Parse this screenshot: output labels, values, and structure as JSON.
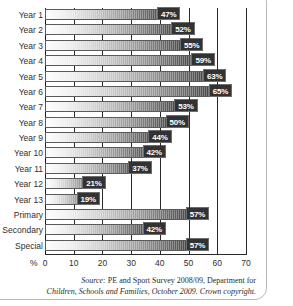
{
  "chart_data": {
    "type": "bar",
    "orientation": "horizontal",
    "title": "",
    "subtitle": "",
    "xlabel": "%",
    "ylabel": "",
    "xlim": [
      0,
      70
    ],
    "xticks": [
      0,
      10,
      20,
      30,
      40,
      50,
      60,
      70
    ],
    "xtick_labels": [
      "0",
      "10",
      "20",
      "30",
      "40",
      "50",
      "60",
      "70"
    ],
    "grid": true,
    "grid_axis": "x",
    "legend": false,
    "legend_position": "none",
    "value_label_suffix": "%",
    "categories": [
      "Year 1",
      "Year 2",
      "Year 3",
      "Year 4",
      "Year 5",
      "Year 6",
      "Year 7",
      "Year 8",
      "Year 9",
      "Year 10",
      "Year 11",
      "Year 12",
      "Year 13",
      "Primary",
      "Secondary",
      "Special"
    ],
    "values": [
      47,
      52,
      55,
      59,
      63,
      65,
      53,
      50,
      44,
      42,
      37,
      21,
      19,
      57,
      42,
      57
    ],
    "value_labels": [
      "47%",
      "52%",
      "55%",
      "59%",
      "63%",
      "65%",
      "53%",
      "50%",
      "44%",
      "42%",
      "37%",
      "21%",
      "19%",
      "57%",
      "42%",
      "57%"
    ],
    "bar_fill": "gradient-white-to-black",
    "bar_edge_color": "#5a5a5a",
    "value_label_bg": "#323232",
    "value_label_color": "#ffffff"
  },
  "caption": {
    "source_word": "Source:",
    "line1": " PE and Sport Survey 2008/09, Department for",
    "line2": "Children, Schools and Families, October 2009. Crown copyright."
  },
  "axis": {
    "percent_symbol": "%"
  }
}
